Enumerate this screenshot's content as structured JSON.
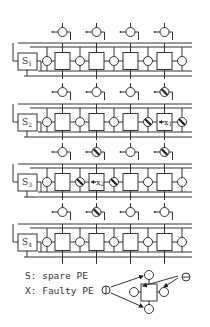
{
  "diagram": {
    "type": "reconfigurable processor array with spare PEs",
    "rows": [
      {
        "spare": "S1",
        "faulty_index": null
      },
      {
        "spare": "S2",
        "faulty_index": 3,
        "faulty_label": "X1"
      },
      {
        "spare": "S3",
        "faulty_index": 1,
        "faulty_label": "X2"
      },
      {
        "spare": "S4",
        "faulty_index": null
      }
    ],
    "columns_per_row": 4
  },
  "legend": {
    "spare": "S: spare PE",
    "faulty": "X: Faulty PE",
    "plus_symbol": "⦶",
    "minus_symbol": "⊝"
  }
}
